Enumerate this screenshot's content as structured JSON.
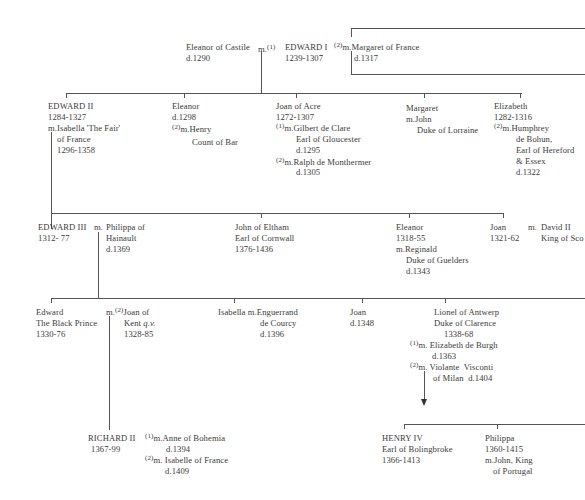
{
  "diagram": {
    "type": "family-tree",
    "generation_1": {
      "edward_i": {
        "name": "EDWARD I",
        "dates": "1239-1307"
      },
      "wife_1": {
        "prefix": "m.",
        "marker": "(1)",
        "name": "Eleanor of Castile",
        "died": "d.1290"
      },
      "wife_2": {
        "marker": "(2)",
        "name": "m.Margaret of France",
        "died": "d.1317"
      }
    },
    "generation_2": [
      {
        "name": "EDWARD II",
        "dates": "1284-1327",
        "spouse_line1": "m.Isabella 'The Fair'",
        "spouse_line2": "of France",
        "spouse_dates": "1296-1358"
      },
      {
        "name": "Eleanor",
        "dates": "d.1298",
        "marker": "(2)",
        "spouse_line1": "m.Henry",
        "spouse_line2": "Count of Bar"
      },
      {
        "name": "Joan of Acre",
        "dates": "1272-1307",
        "marker1": "(1)",
        "spouse1_line1": "m.Gilbert de Clare",
        "spouse1_line2": "Earl of Gloucester",
        "spouse1_died": "d.1295",
        "marker2": "(2)",
        "spouse2_line1": "m.Ralph de Monthermer",
        "spouse2_died": "d.1305"
      },
      {
        "name": "Margaret",
        "spouse_line1": "m.John",
        "spouse_line2": "Duke of Lorraine"
      },
      {
        "name": "Elizabeth",
        "dates": "1282-1316",
        "marker": "(2)",
        "spouse_line1": "m.Humphrey",
        "spouse_line2": "de Bohun,",
        "spouse_line3": "Earl of Hereford",
        "spouse_line4": "& Essex",
        "spouse_died": "d.1322"
      }
    ],
    "generation_3": [
      {
        "name": "EDWARD III",
        "dates": "1312- 77",
        "prefix": "m.",
        "spouse_line1": "Philippa of",
        "spouse_line2": "Hainault",
        "spouse_died": "d.1369"
      },
      {
        "name": "John of Eltham",
        "title": "Earl of Cornwall",
        "dates": "1376-1436"
      },
      {
        "name": "Eleanor",
        "dates": "1318-55",
        "spouse_line1": "m.Reginald",
        "spouse_line2": "Duke of Guelders",
        "spouse_died": "d.1343"
      },
      {
        "name": "Joan",
        "dates": "1321-62",
        "prefix": "m.",
        "spouse_line1": "David II",
        "spouse_line2": "King of Sco"
      }
    ],
    "generation_4": [
      {
        "name": "Edward",
        "title": "The Black Prince",
        "dates": "1330-76",
        "prefix": "m.",
        "marker": "(2)",
        "spouse_line1": "Joan of",
        "spouse_line2_a": "Kent ",
        "spouse_line2_b": "q.v.",
        "spouse_dates": "1328-85"
      },
      {
        "name": "Isabella",
        "prefix": "m.",
        "spouse_line1": "Enguerrand",
        "spouse_line2": "de Courcy",
        "spouse_died": "d.1396"
      },
      {
        "name": "Joan",
        "dates": "d.1348"
      },
      {
        "name": "Lionel of Antwerp",
        "title": "Duke of Clarence",
        "dates": "1338-68",
        "marker1": "(1)",
        "spouse1_line1": "m. Elizabeth de Burgh",
        "spouse1_died": "d.1363",
        "marker2": "(2)",
        "spouse2_line1": "m. Violante  Visconti",
        "spouse2_line2": "of Milan  d.1404"
      }
    ],
    "generation_5": [
      {
        "name": "RICHARD II",
        "dates": "1367-99",
        "marker1": "(1)",
        "spouse1_line1": "m.Anne of Bohemia",
        "spouse1_died": "d.1394",
        "marker2": "(2)",
        "spouse2_line1": "m. Isabelle of France",
        "spouse2_died": "d.1409"
      },
      {
        "name": "HENRY IV",
        "title": "Earl of Bolingbroke",
        "dates": "1366-1413"
      },
      {
        "name": "Philippa",
        "dates": "1360-1415",
        "spouse_line1": "m.John, King",
        "spouse_line2": "of Portugal"
      }
    ]
  }
}
